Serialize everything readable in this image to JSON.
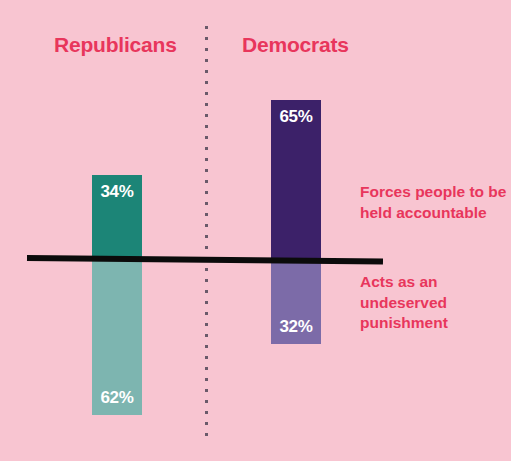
{
  "chart_data": {
    "type": "bar",
    "title": "",
    "subtitle": "",
    "xlabel": "",
    "ylabel": "",
    "orientation": "vertical-diverging",
    "grid": false,
    "legend_position": "right",
    "baseline_value": 0,
    "categories": [
      "Republicans",
      "Democrats"
    ],
    "series": [
      {
        "name": "Forces people to be held accountable",
        "direction": "above-baseline",
        "values": [
          34,
          65
        ],
        "value_labels": [
          "34%",
          "62%"
        ],
        "colors": [
          "#1c8577",
          "#3c2169"
        ]
      },
      {
        "name": "Acts as an undeserved punishment",
        "direction": "below-baseline",
        "values": [
          62,
          32
        ],
        "value_labels": [
          "62%",
          "32%"
        ],
        "colors": [
          "#7db5b0",
          "#7c6ba8"
        ]
      }
    ],
    "annotations": []
  },
  "headings": {
    "republicans": "Republicans",
    "democrats": "Democrats"
  },
  "bars": {
    "republicans": {
      "group": "Republicans",
      "above_label": "34%",
      "below_label": "62%",
      "above_value": 34,
      "below_value": 62,
      "above_color": "#1c8577",
      "below_color": "#7db5b0"
    },
    "democrats": {
      "group": "Democrats",
      "above_label": "65%",
      "below_label": "32%",
      "above_value": 65,
      "below_value": 32,
      "above_color": "#3c2169",
      "below_color": "#7c6ba8"
    }
  },
  "legend": {
    "above": "Forces people to be held accountable",
    "below": "Acts as an undeserved punishment"
  },
  "colors": {
    "background": "#f8c5d1",
    "heading_text": "#e8365c",
    "legend_text": "#e8365c",
    "baseline": "#0b0b0b",
    "separator_dots": "#6a5a6a",
    "value_label_text": "#ffffff"
  }
}
